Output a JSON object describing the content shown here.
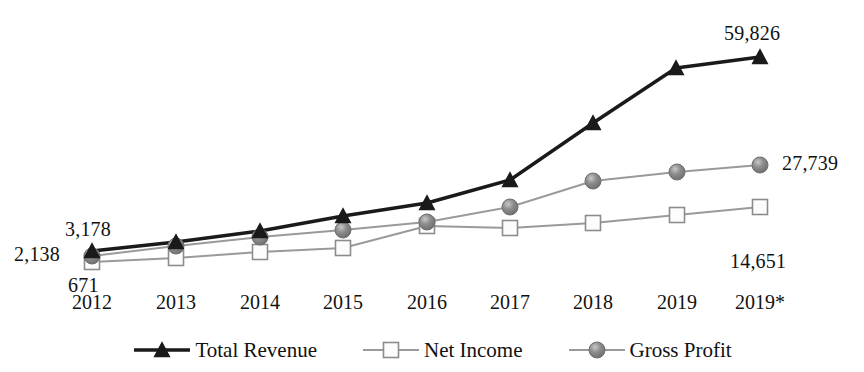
{
  "chart_data": {
    "type": "line",
    "title": "",
    "subtitle": "",
    "xlabel": "",
    "ylabel": "",
    "grid": false,
    "legend_position": "bottom",
    "categories": [
      "2012",
      "2013",
      "2014",
      "2015",
      "2016",
      "2017",
      "2018",
      "2019",
      "2019*"
    ],
    "ylim": [
      0,
      62000
    ],
    "series": [
      {
        "name": "Total Revenue",
        "marker": "triangle",
        "color": "#1a1a1a",
        "line_color": "#1a1a1a",
        "values": [
          3178,
          4100,
          5200,
          6800,
          9100,
          14300,
          24100,
          39900,
          59826
        ],
        "pixels": [
          {
            "x": 92,
            "y": 251
          },
          {
            "x": 176,
            "y": 242
          },
          {
            "x": 260,
            "y": 231
          },
          {
            "x": 343,
            "y": 216
          },
          {
            "x": 427,
            "y": 203
          },
          {
            "x": 510,
            "y": 180
          },
          {
            "x": 593,
            "y": 123
          },
          {
            "x": 676,
            "y": 68
          },
          {
            "x": 760,
            "y": 57
          }
        ]
      },
      {
        "name": "Gross Profit",
        "marker": "circle",
        "color": "#808080",
        "line_color": "#9a9a9a",
        "values": [
          2138,
          2600,
          3400,
          4300,
          6100,
          9400,
          17600,
          23500,
          27739
        ],
        "pixels": [
          {
            "x": 92,
            "y": 256
          },
          {
            "x": 176,
            "y": 246
          },
          {
            "x": 260,
            "y": 237
          },
          {
            "x": 343,
            "y": 230
          },
          {
            "x": 427,
            "y": 222
          },
          {
            "x": 510,
            "y": 207
          },
          {
            "x": 593,
            "y": 181
          },
          {
            "x": 677,
            "y": 172
          },
          {
            "x": 760,
            "y": 165
          }
        ]
      },
      {
        "name": "Net Income",
        "marker": "square",
        "color": "#fcfcfc",
        "line_color": "#9a9a9a",
        "values": [
          671,
          1100,
          1700,
          2200,
          5300,
          3700,
          6200,
          10800,
          14651
        ],
        "pixels": [
          {
            "x": 92,
            "y": 262
          },
          {
            "x": 176,
            "y": 258
          },
          {
            "x": 260,
            "y": 252
          },
          {
            "x": 343,
            "y": 248
          },
          {
            "x": 427,
            "y": 226
          },
          {
            "x": 510,
            "y": 228
          },
          {
            "x": 593,
            "y": 223
          },
          {
            "x": 677,
            "y": 215
          },
          {
            "x": 760,
            "y": 207
          }
        ]
      }
    ],
    "annotations": [
      {
        "text": "3,178",
        "series": "Total Revenue",
        "category": "2012",
        "value": 3178,
        "x": 65,
        "y": 218,
        "align": "left"
      },
      {
        "text": "2,138",
        "series": "Gross Profit",
        "category": "2012",
        "value": 2138,
        "x": 14,
        "y": 243,
        "align": "left"
      },
      {
        "text": "671",
        "series": "Net Income",
        "category": "2012",
        "value": 671,
        "x": 68,
        "y": 274,
        "align": "left"
      },
      {
        "text": "59,826",
        "series": "Total Revenue",
        "category": "2019*",
        "value": 59826,
        "x": 724,
        "y": 22,
        "align": "left"
      },
      {
        "text": "27,739",
        "series": "Gross Profit",
        "category": "2019*",
        "value": 27739,
        "x": 782,
        "y": 152,
        "align": "left"
      },
      {
        "text": "14,651",
        "series": "Net Income",
        "category": "2019*",
        "value": 14651,
        "x": 730,
        "y": 250,
        "align": "left"
      }
    ],
    "tick_positions": [
      92,
      176,
      260,
      343,
      427,
      510,
      593,
      677,
      760
    ],
    "tick_label_y": 291
  },
  "legend": {
    "items": [
      {
        "label": "Total Revenue",
        "marker": "triangle",
        "color": "#1a1a1a",
        "line_color": "#1a1a1a"
      },
      {
        "label": "Net Income",
        "marker": "square",
        "color": "#fcfcfc",
        "line_color": "#9a9a9a"
      },
      {
        "label": "Gross Profit",
        "marker": "circle",
        "color": "#808080",
        "line_color": "#9a9a9a"
      }
    ]
  }
}
